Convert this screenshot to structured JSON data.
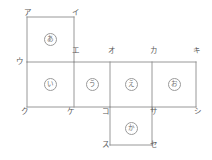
{
  "figure": {
    "type": "cube-net-diagram",
    "line_color": "#8c8c8c",
    "label_color": "#5a5a5a",
    "background": "#ffffff",
    "grid": {
      "columns_x": [
        27,
        74,
        110,
        152,
        196
      ],
      "rows_y": [
        17,
        62,
        107,
        145
      ]
    },
    "faces": [
      {
        "id": "face-a",
        "label": "あ",
        "cx": 50,
        "cy": 39,
        "col": 1,
        "row": 1
      },
      {
        "id": "face-i",
        "label": "い",
        "cx": 50,
        "cy": 84,
        "col": 1,
        "row": 2
      },
      {
        "id": "face-u",
        "label": "う",
        "cx": 92,
        "cy": 84,
        "col": 2,
        "row": 2
      },
      {
        "id": "face-e",
        "label": "え",
        "cx": 131,
        "cy": 84,
        "col": 3,
        "row": 2
      },
      {
        "id": "face-o",
        "label": "お",
        "cx": 174,
        "cy": 84,
        "col": 4,
        "row": 2
      },
      {
        "id": "face-ka",
        "label": "か",
        "cx": 131,
        "cy": 128,
        "col": 3,
        "row": 3
      }
    ],
    "vertices": [
      {
        "id": "vertex-a",
        "label": "ア",
        "x": 24,
        "y": 9
      },
      {
        "id": "vertex-i",
        "label": "イ",
        "x": 72,
        "y": 9
      },
      {
        "id": "vertex-u",
        "label": "ウ",
        "x": 16,
        "y": 58
      },
      {
        "id": "vertex-e",
        "label": "エ",
        "x": 72,
        "y": 47
      },
      {
        "id": "vertex-o",
        "label": "オ",
        "x": 108,
        "y": 47
      },
      {
        "id": "vertex-ka",
        "label": "カ",
        "x": 150,
        "y": 47
      },
      {
        "id": "vertex-ki",
        "label": "キ",
        "x": 193,
        "y": 47
      },
      {
        "id": "vertex-ku",
        "label": "ク",
        "x": 21,
        "y": 108
      },
      {
        "id": "vertex-ke",
        "label": "ケ",
        "x": 67,
        "y": 108
      },
      {
        "id": "vertex-ko",
        "label": "コ",
        "x": 102,
        "y": 108
      },
      {
        "id": "vertex-sa",
        "label": "サ",
        "x": 150,
        "y": 108
      },
      {
        "id": "vertex-shi",
        "label": "シ",
        "x": 194,
        "y": 108
      },
      {
        "id": "vertex-su",
        "label": "ス",
        "x": 102,
        "y": 141
      },
      {
        "id": "vertex-se",
        "label": "セ",
        "x": 150,
        "y": 141
      }
    ],
    "edges": [
      {
        "id": "edge-top-a",
        "x1": 27,
        "y1": 17,
        "x2": 74,
        "y2": 17
      },
      {
        "id": "edge-left-a",
        "x1": 27,
        "y1": 17,
        "x2": 27,
        "y2": 62
      },
      {
        "id": "edge-right-a",
        "x1": 74,
        "y1": 17,
        "x2": 74,
        "y2": 62
      },
      {
        "id": "edge-middle-top",
        "x1": 27,
        "y1": 62,
        "x2": 196,
        "y2": 62
      },
      {
        "id": "edge-middle-bottom",
        "x1": 27,
        "y1": 107,
        "x2": 196,
        "y2": 107
      },
      {
        "id": "edge-left-i",
        "x1": 27,
        "y1": 62,
        "x2": 27,
        "y2": 107
      },
      {
        "id": "edge-i-u",
        "x1": 74,
        "y1": 62,
        "x2": 74,
        "y2": 107
      },
      {
        "id": "edge-u-e",
        "x1": 110,
        "y1": 62,
        "x2": 110,
        "y2": 107
      },
      {
        "id": "edge-e-o",
        "x1": 152,
        "y1": 62,
        "x2": 152,
        "y2": 107
      },
      {
        "id": "edge-right-o",
        "x1": 196,
        "y1": 62,
        "x2": 196,
        "y2": 107
      },
      {
        "id": "edge-left-ka",
        "x1": 110,
        "y1": 107,
        "x2": 110,
        "y2": 145
      },
      {
        "id": "edge-right-ka",
        "x1": 152,
        "y1": 107,
        "x2": 152,
        "y2": 145
      },
      {
        "id": "edge-bottom-ka",
        "x1": 110,
        "y1": 145,
        "x2": 152,
        "y2": 145
      }
    ]
  }
}
